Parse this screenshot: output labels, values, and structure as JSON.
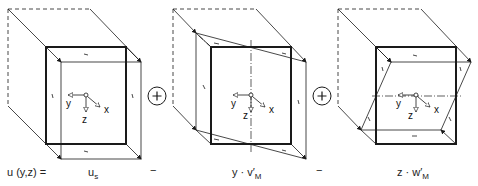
{
  "diagram": {
    "equation": {
      "lhs": "u (y,z) =",
      "term1": {
        "base": "u",
        "sub": "s"
      },
      "op1": "−",
      "term2": {
        "prefix": "y · v",
        "prime": "′",
        "sub": "M"
      },
      "op2": "−",
      "term3": {
        "prefix": "z · w",
        "prime": "′",
        "sub": "M"
      }
    },
    "plus_symbols": [
      "+",
      "+"
    ],
    "axes": {
      "x": "x",
      "y": "y",
      "z": "z"
    },
    "panels": [
      {
        "name": "uniform-translation"
      },
      {
        "name": "rotation-about-z"
      },
      {
        "name": "rotation-about-y"
      }
    ],
    "colors": {
      "line": "#1a1a1a",
      "background": "#ffffff"
    }
  }
}
